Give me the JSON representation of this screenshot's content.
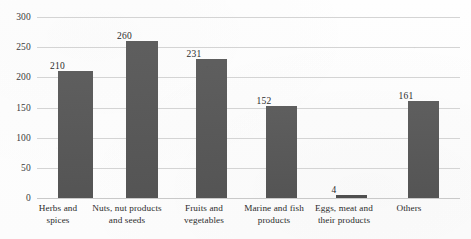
{
  "chart_data": {
    "type": "bar",
    "title": "",
    "subtitle": "",
    "xlabel": "",
    "ylabel": "",
    "ylim": [
      0,
      300
    ],
    "yticks": [
      0,
      50,
      100,
      150,
      200,
      250,
      300
    ],
    "ytick_labels": [
      "0",
      "50",
      "100",
      "150",
      "200",
      "250",
      "300"
    ],
    "grid": true,
    "legend": false,
    "bar_color": "#575757",
    "gridline_color": "#d4d4d4",
    "categories": [
      "Herbs and spices",
      "Nuts, nut products and seeds",
      "Fruits and vegetables",
      "Marine and fish products",
      "Eggs, meat and their products",
      "Others"
    ],
    "category_lines": [
      [
        "Herbs and spices"
      ],
      [
        "Nuts, nut products",
        "and seeds"
      ],
      [
        "Fruits and",
        "vegetables"
      ],
      [
        "Marine and fish",
        "products"
      ],
      [
        "Eggs, meat and",
        "their products"
      ],
      [
        "Others"
      ]
    ],
    "values": [
      210,
      260,
      231,
      152,
      4,
      161
    ],
    "value_labels": [
      "210",
      "260",
      "231",
      "152",
      "4",
      "161"
    ]
  }
}
